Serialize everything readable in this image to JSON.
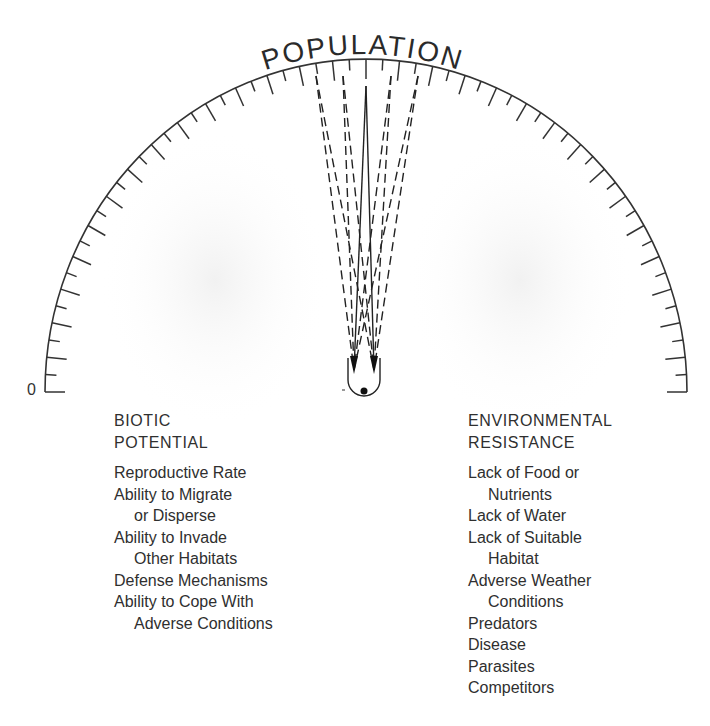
{
  "diagram": {
    "title": "POPULATION",
    "scale_zero_label": "0",
    "gauge": {
      "center_x": 366,
      "center_y": 392,
      "radius_x": 321,
      "radius_y": 333,
      "tick_count": 60,
      "long_tick_length": 20,
      "short_tick_length": 11,
      "line_color": "#333333"
    },
    "needle": {
      "pivot_x": 364,
      "pivot_y": 378,
      "bulb_width": 32,
      "indicator_lines": [
        {
          "style": "dashed",
          "top_x": 316,
          "top_y": 76
        },
        {
          "style": "dashed",
          "top_x": 343,
          "top_y": 76
        },
        {
          "style": "solid",
          "top_x": 366,
          "top_y": 86
        },
        {
          "style": "dashed",
          "top_x": 391,
          "top_y": 76
        },
        {
          "style": "dashed",
          "top_x": 418,
          "top_y": 76
        }
      ]
    },
    "left_column": {
      "heading": [
        "BIOTIC",
        "POTENTIAL"
      ],
      "items": [
        {
          "line1": "Reproductive Rate",
          "line2": ""
        },
        {
          "line1": "Ability to Migrate",
          "line2": "or Disperse"
        },
        {
          "line1": "Ability to Invade",
          "line2": "Other Habitats"
        },
        {
          "line1": "Defense Mechanisms",
          "line2": ""
        },
        {
          "line1": "Ability to Cope With",
          "line2": "Adverse Conditions"
        }
      ]
    },
    "right_column": {
      "heading": [
        "ENVIRONMENTAL",
        "RESISTANCE"
      ],
      "items": [
        {
          "line1": "Lack of Food or",
          "line2": "Nutrients"
        },
        {
          "line1": "Lack of Water",
          "line2": ""
        },
        {
          "line1": "Lack of Suitable",
          "line2": "Habitat"
        },
        {
          "line1": "Adverse Weather",
          "line2": "Conditions"
        },
        {
          "line1": "Predators",
          "line2": ""
        },
        {
          "line1": "Disease",
          "line2": ""
        },
        {
          "line1": "Parasites",
          "line2": ""
        },
        {
          "line1": "Competitors",
          "line2": ""
        }
      ]
    }
  }
}
